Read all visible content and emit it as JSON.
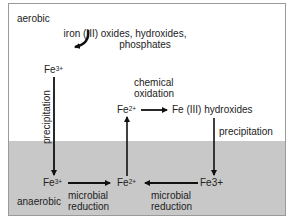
{
  "zones": {
    "aerobic_label": "aerobic",
    "anaerobic_label": "anaerobic",
    "colors": {
      "aerobic": "#ffffff",
      "anaerobic": "#c8c8c8",
      "border": "#9a9a9a",
      "arrow": "#111111"
    }
  },
  "nodes": {
    "source_line1": "iron (III) oxides, hydroxides,",
    "source_line2": "phosphates",
    "fe3_top": {
      "base": "Fe",
      "sup": "3+"
    },
    "fe2_mid": {
      "base": "Fe",
      "sup": "2+"
    },
    "fe3_hydroxides": "Fe (III) hydroxides",
    "fe3_bottom_left": {
      "base": "Fe",
      "sup": "3+"
    },
    "fe2_bottom": {
      "base": "Fe",
      "sup": "2+"
    },
    "fe3_bottom_right": "Fe3+"
  },
  "labels": {
    "precipitation_left": "precipitation",
    "chemical_oxidation_1": "chemical",
    "chemical_oxidation_2": "oxidation",
    "precipitation_right": "precipitation",
    "microbial_reduction_left_1": "microbial",
    "microbial_reduction_left_2": "reduction",
    "microbial_reduction_right_1": "microbial",
    "microbial_reduction_right_2": "reduction"
  }
}
